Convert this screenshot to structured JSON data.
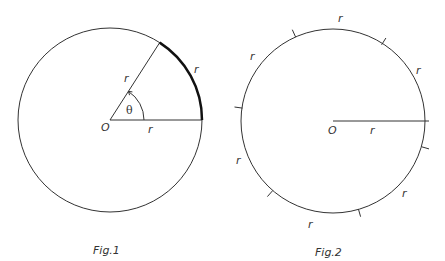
{
  "fig1": {
    "caption": "Fig.1",
    "center_label": "O",
    "radius_label": "r",
    "side_label": "r",
    "arc_label": "r",
    "angle_label": "θ"
  },
  "fig2": {
    "caption": "Fig.2",
    "center_label": "O",
    "radius_label": "r",
    "arc_labels": [
      "r",
      "r",
      "r",
      "r",
      "r",
      "r"
    ]
  },
  "colors": {
    "stroke": "#333333",
    "arc_highlight": "#111111",
    "background": "#ffffff"
  }
}
